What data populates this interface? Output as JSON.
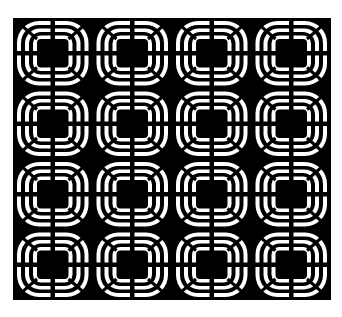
{
  "artwork": {
    "description": "Black and white op-art tile pattern",
    "columns": 4,
    "rows": 4,
    "colors": {
      "background": "#ffffff",
      "ink": "#000000",
      "paper": "#ffffff"
    },
    "frame": {
      "x": 13,
      "y": 18,
      "width": 318,
      "height": 282
    }
  }
}
